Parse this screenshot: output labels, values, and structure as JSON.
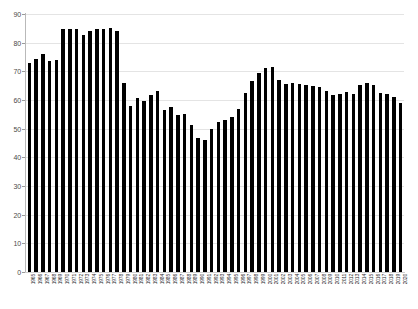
{
  "chart_data": {
    "type": "bar",
    "title": "",
    "subtitle": "",
    "xlabel": "",
    "ylabel": "",
    "ylim": [
      0,
      90
    ],
    "yticks": [
      0,
      10,
      20,
      30,
      40,
      50,
      60,
      70,
      80,
      90
    ],
    "grid": true,
    "legend": false,
    "bar_color": "#000000",
    "grid_color": "#e4e4e4",
    "axis_color": "#b9b9b9",
    "categories": [
      "1965",
      "1966",
      "1967",
      "1968",
      "1969",
      "1970",
      "1971",
      "1972",
      "1973",
      "1974",
      "1975",
      "1976",
      "1977",
      "1978",
      "1979",
      "1980",
      "1981",
      "1982",
      "1983",
      "1984",
      "1985",
      "1986",
      "1987",
      "1988",
      "1989",
      "1990",
      "1991",
      "1992",
      "1993",
      "1994",
      "1995",
      "1996",
      "1997",
      "1998",
      "1999",
      "2000",
      "2001",
      "2002",
      "2003",
      "2004",
      "2005",
      "2006",
      "2007",
      "2008",
      "2009",
      "2010",
      "2011",
      "2012",
      "2013",
      "2014",
      "2015",
      "2016",
      "2017",
      "2018",
      "2019",
      "2020"
    ],
    "values": [
      73.0,
      74.4,
      76.1,
      73.5,
      74.0,
      84.7,
      84.6,
      84.8,
      82.7,
      84.0,
      84.6,
      84.6,
      85.2,
      84.1,
      66.1,
      58.0,
      60.8,
      59.6,
      61.7,
      63.0,
      56.5,
      57.5,
      54.9,
      55.1,
      51.4,
      46.8,
      46.0,
      49.8,
      52.2,
      53.0,
      54.0,
      57.0,
      62.4,
      66.5,
      69.5,
      71.3,
      71.5,
      67.0,
      65.6,
      66.0,
      65.7,
      65.2,
      64.9,
      64.5,
      63.3,
      61.8,
      62.1,
      62.9,
      62.0,
      65.3,
      65.9,
      65.2,
      62.5,
      62.0,
      61.0,
      59.0
    ]
  }
}
